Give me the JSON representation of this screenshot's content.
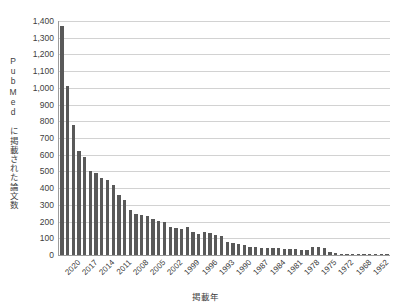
{
  "chart_data": {
    "type": "bar",
    "title": "",
    "xlabel": "掲載年",
    "ylabel": "PubMed に掲載された論文数",
    "ylim": [
      0,
      1400
    ],
    "ytick_step": 100,
    "grid": true,
    "legend": false,
    "bar_color": "#595959",
    "gridline_color": "#d2d2d2",
    "axis_color": "#9c9c9c",
    "ytick_labels": [
      "1,400",
      "1,300",
      "1,200",
      "1,100",
      "1,000",
      "900",
      "800",
      "700",
      "600",
      "500",
      "400",
      "300",
      "200",
      "100",
      "0"
    ],
    "ytick_values": [
      1400,
      1300,
      1200,
      1100,
      1000,
      900,
      800,
      700,
      600,
      500,
      400,
      300,
      200,
      100,
      0
    ],
    "xtick_labels": [
      "2020",
      "2017",
      "2014",
      "2011",
      "2008",
      "2005",
      "2002",
      "1999",
      "1996",
      "1993",
      "1990",
      "1987",
      "1984",
      "1981",
      "1978",
      "1975",
      "1972",
      "1968",
      "1952",
      "1931"
    ],
    "xtick_interval": 3,
    "xtick_first_index": 1,
    "categories": [
      "2021",
      "2020",
      "2019",
      "2018",
      "2017",
      "2016",
      "2015",
      "2014",
      "2013",
      "2012",
      "2011",
      "2010",
      "2009",
      "2008",
      "2007",
      "2006",
      "2005",
      "2004",
      "2003",
      "2002",
      "2001",
      "2000",
      "1999",
      "1998",
      "1997",
      "1996",
      "1995",
      "1994",
      "1993",
      "1992",
      "1991",
      "1990",
      "1989",
      "1988",
      "1987",
      "1986",
      "1985",
      "1984",
      "1983",
      "1982",
      "1981",
      "1980",
      "1979",
      "1978",
      "1977",
      "1976",
      "1975",
      "1974",
      "1973",
      "1972",
      "1971",
      "1970",
      "1968",
      "1965",
      "1962",
      "1952",
      "1944",
      "1931"
    ],
    "values": [
      1370,
      1010,
      775,
      620,
      585,
      505,
      490,
      460,
      450,
      420,
      360,
      330,
      270,
      245,
      240,
      235,
      215,
      205,
      195,
      170,
      160,
      155,
      170,
      140,
      125,
      135,
      130,
      120,
      115,
      80,
      70,
      65,
      60,
      50,
      45,
      40,
      40,
      40,
      40,
      35,
      35,
      35,
      30,
      30,
      45,
      45,
      40,
      20,
      15,
      8,
      5,
      4,
      3,
      3,
      2,
      2,
      1,
      1
    ]
  }
}
